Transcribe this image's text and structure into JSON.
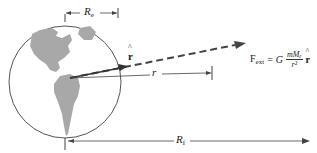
{
  "diagram": {
    "labels": {
      "earth_radius": "R",
      "earth_radius_sub": "e",
      "distance": "r",
      "unit_vector": "r̂",
      "total_distance": "R",
      "total_distance_sub": "f"
    },
    "formula": {
      "lhs": "F",
      "lhs_sub": "ext",
      "equals": "=",
      "constant": "G",
      "numerator": "mMₑ",
      "denominator": "r²",
      "unit_vector": "r"
    },
    "colors": {
      "earth_outline": "#555555",
      "landmass": "#a8a8a8",
      "arrow": "#444444",
      "text": "#222222"
    }
  }
}
